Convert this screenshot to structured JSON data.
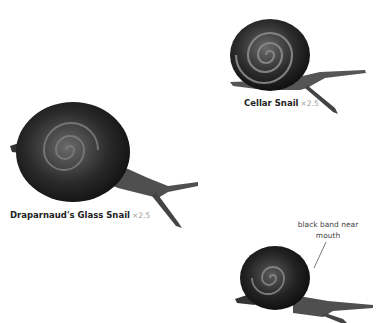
{
  "figures": [
    {
      "id": "cellar-snail",
      "name": "Cellar Snail",
      "scale": "×2.5"
    },
    {
      "id": "draparnauds-glass-snail",
      "name": "Draparnaud's Glass Snail",
      "scale": "×2.5"
    },
    {
      "id": "third-snail",
      "annotation_line1": "black band near",
      "annotation_line2": "mouth"
    }
  ],
  "colors": {
    "shell_dark": "#1c1c1c",
    "shell_mid": "#4a4a4a",
    "shell_highlight": "#9a9a9a",
    "body": "#5a5a5a",
    "label_text": "#222222",
    "scale_text": "#9a9a9a"
  }
}
